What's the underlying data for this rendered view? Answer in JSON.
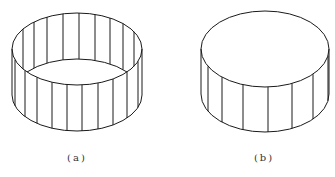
{
  "figures": [
    {
      "id": "a",
      "label": "(a)",
      "description": "open cylinder (ring wall, no top)",
      "cx": 77,
      "cy_top": 49,
      "rx": 65,
      "ry": 36,
      "height": 46,
      "front_lines_x": [
        15,
        25,
        37,
        52,
        67,
        82,
        98,
        113,
        127,
        138
      ],
      "back_lines_x": [
        23,
        34,
        47,
        63,
        79,
        95,
        110,
        123,
        134,
        142
      ]
    },
    {
      "id": "b",
      "label": "(b)",
      "description": "closed cylinder (with top face)",
      "cx": 265,
      "cy_top": 49,
      "rx": 64,
      "ry": 38,
      "height": 45,
      "front_lines_x": [
        208,
        222,
        243,
        268,
        292,
        313,
        328
      ]
    }
  ],
  "colors": {
    "stroke": "#1a1a1a",
    "background": "#ffffff"
  }
}
